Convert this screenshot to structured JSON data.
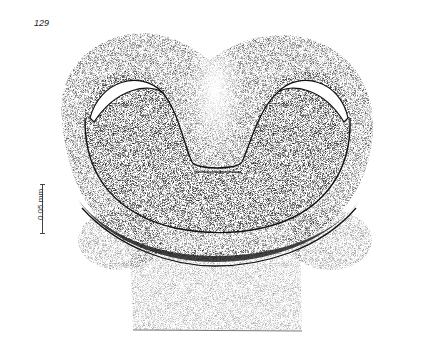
{
  "page": {
    "header_text": "",
    "figure_number": "129",
    "scale_bar": {
      "label": "0.05 mm"
    },
    "figure": {
      "description": "Stippled illustration of a U-shaped (bilobed) tissue section with two dark-rimmed lobes, pale central cleft, and a lighter stippled stalk/base below",
      "ink_color": "#1a1a1a",
      "background_color": "#ffffff"
    }
  }
}
